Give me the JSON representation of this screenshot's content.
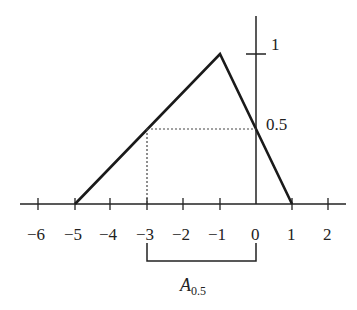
{
  "diagram": {
    "type": "fuzzy-membership-alpha-cut",
    "x_ticks": [
      "−6",
      "−5",
      "−4",
      "−3",
      "−2",
      "−1",
      "0",
      "1",
      "2"
    ],
    "y_labels": {
      "one": "1",
      "half": "0.5"
    },
    "membership_points": [
      [
        -5,
        0
      ],
      [
        -1,
        1
      ],
      [
        1,
        0
      ]
    ],
    "alpha_level": 0.5,
    "alpha_cut_interval": [
      -3,
      0
    ],
    "cut_label": {
      "main": "A",
      "subscript": "0.5"
    },
    "colors": {
      "line": "#1a1a1a",
      "dotted": "#444444"
    }
  }
}
